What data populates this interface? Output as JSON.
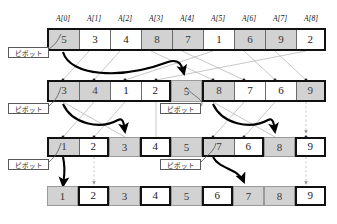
{
  "figure": {
    "language": "ja",
    "pivot_label": "ピボット",
    "colors": {
      "gray_fill": "#d2d2d2",
      "white_fill": "#ffffff",
      "bold_border": "#111111",
      "thin_border": "#9a9a9a",
      "arrow_thick": "#000000",
      "arrow_thin": "#b5b5b5"
    }
  },
  "headers": [
    {
      "label": "A[0]"
    },
    {
      "label": "A[1]"
    },
    {
      "label": "A[2]"
    },
    {
      "label": "A[3]"
    },
    {
      "label": "A[4]"
    },
    {
      "label": "A[5]"
    },
    {
      "label": "A[6]"
    },
    {
      "label": "A[7]"
    },
    {
      "label": "A[8]"
    }
  ],
  "rows": [
    {
      "name": "row-1-initial",
      "pivot_label": "ピボット",
      "pivots": [
        0
      ],
      "groups": [
        {
          "name": "group-full",
          "style": "bold",
          "cells": [
            {
              "value": "5",
              "fill": "gray"
            },
            {
              "value": "3",
              "fill": "white"
            },
            {
              "value": "4",
              "fill": "white"
            },
            {
              "value": "8",
              "fill": "gray"
            },
            {
              "value": "7",
              "fill": "gray"
            },
            {
              "value": "1",
              "fill": "white"
            },
            {
              "value": "6",
              "fill": "gray"
            },
            {
              "value": "9",
              "fill": "gray"
            },
            {
              "value": "2",
              "fill": "white"
            }
          ]
        }
      ]
    },
    {
      "name": "row-2-after-first-partition",
      "pivot_label": "ピボット",
      "groups": [
        {
          "name": "group-left",
          "style": "bold",
          "cells": [
            {
              "value": "3",
              "fill": "gray"
            },
            {
              "value": "4",
              "fill": "gray"
            },
            {
              "value": "1",
              "fill": "white"
            },
            {
              "value": "2",
              "fill": "white"
            }
          ]
        },
        {
          "name": "group-pivot-5",
          "style": "thin",
          "cells": [
            {
              "value": "5",
              "fill": "gray"
            }
          ]
        },
        {
          "name": "group-right",
          "style": "bold",
          "cells": [
            {
              "value": "8",
              "fill": "gray"
            },
            {
              "value": "7",
              "fill": "white"
            },
            {
              "value": "6",
              "fill": "white"
            },
            {
              "value": "9",
              "fill": "gray"
            }
          ]
        }
      ]
    },
    {
      "name": "row-3-after-second-partition",
      "pivot_label": "ピボット",
      "groups": [
        {
          "name": "group-1-2",
          "style": "bold",
          "cells": [
            {
              "value": "1",
              "fill": "gray"
            },
            {
              "value": "2",
              "fill": "white"
            }
          ]
        },
        {
          "name": "group-pivot-3",
          "style": "thin",
          "cells": [
            {
              "value": "3",
              "fill": "gray"
            }
          ]
        },
        {
          "name": "group-4",
          "style": "bold",
          "cells": [
            {
              "value": "4",
              "fill": "white"
            }
          ]
        },
        {
          "name": "group-sorted-5",
          "style": "thin",
          "cells": [
            {
              "value": "5",
              "fill": "gray"
            }
          ]
        },
        {
          "name": "group-7-6",
          "style": "bold",
          "cells": [
            {
              "value": "7",
              "fill": "gray"
            },
            {
              "value": "6",
              "fill": "white"
            }
          ]
        },
        {
          "name": "group-pivot-8",
          "style": "thin",
          "cells": [
            {
              "value": "8",
              "fill": "gray"
            }
          ]
        },
        {
          "name": "group-9",
          "style": "bold",
          "cells": [
            {
              "value": "9",
              "fill": "white"
            }
          ]
        }
      ]
    },
    {
      "name": "row-4-sorted",
      "groups": [
        {
          "name": "group-1",
          "style": "thin",
          "cells": [
            {
              "value": "1",
              "fill": "gray"
            }
          ]
        },
        {
          "name": "group-2",
          "style": "bold",
          "cells": [
            {
              "value": "2",
              "fill": "white"
            }
          ]
        },
        {
          "name": "group-3",
          "style": "thin",
          "cells": [
            {
              "value": "3",
              "fill": "gray"
            }
          ]
        },
        {
          "name": "group-4",
          "style": "bold",
          "cells": [
            {
              "value": "4",
              "fill": "white"
            }
          ]
        },
        {
          "name": "group-5",
          "style": "thin",
          "cells": [
            {
              "value": "5",
              "fill": "gray"
            }
          ]
        },
        {
          "name": "group-6",
          "style": "bold",
          "cells": [
            {
              "value": "6",
              "fill": "white"
            }
          ]
        },
        {
          "name": "group-7",
          "style": "thin",
          "cells": [
            {
              "value": "7",
              "fill": "gray"
            }
          ]
        },
        {
          "name": "group-8",
          "style": "thin",
          "cells": [
            {
              "value": "8",
              "fill": "gray"
            }
          ]
        },
        {
          "name": "group-9",
          "style": "bold",
          "cells": [
            {
              "value": "9",
              "fill": "white"
            }
          ]
        }
      ]
    }
  ],
  "pivot_boxes": [
    {
      "name": "pivot-label-row1",
      "label": "ピボット",
      "x": 8,
      "y": 47
    },
    {
      "name": "pivot-label-row2-left",
      "label": "ピボット",
      "x": 8,
      "y": 103
    },
    {
      "name": "pivot-label-row2-mid",
      "label": "ピボット",
      "x": 160,
      "y": 103
    },
    {
      "name": "pivot-label-row3-left",
      "label": "ピボット",
      "x": 8,
      "y": 159
    },
    {
      "name": "pivot-label-row3-mid",
      "label": "ピボット",
      "x": 160,
      "y": 159
    }
  ]
}
